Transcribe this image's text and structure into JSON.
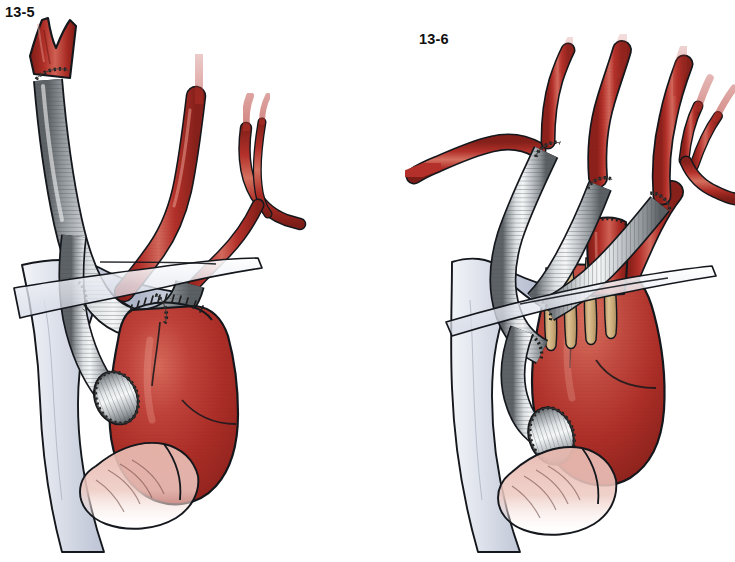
{
  "plate": {
    "background_color": "#ffffff",
    "width": 735,
    "height": 562,
    "subject": "surgical-illustration-aortic-arch-debranching-bypass-grafts"
  },
  "figures": [
    {
      "id": "fig-13-5",
      "label": "13-5",
      "label_position": {
        "x": 5,
        "y": 4
      },
      "description": "single prosthetic bypass graft from ascending aorta to brachiocephalic artery",
      "parts": [
        {
          "name": "ascending-aorta",
          "color": "#b3312a"
        },
        {
          "name": "corrugated-dacron-graft",
          "color": "#c9ccce"
        },
        {
          "name": "proximal-anastomosis-suture-ring",
          "color": "#2b2b2b"
        },
        {
          "name": "distal-anastomosis-suture-line",
          "color": "#2b2b2b"
        },
        {
          "name": "brachiocephalic-artery-stump",
          "color": "#a82b24"
        },
        {
          "name": "left-common-carotid-artery",
          "color": "#b3312a"
        },
        {
          "name": "bifurcating-branch-vessel",
          "color": "#b3312a"
        },
        {
          "name": "pulmonary-artery",
          "color": "#cdd2de"
        },
        {
          "name": "pericardial-veil",
          "color": "#e6e9f1"
        },
        {
          "name": "atrial-appendage-tissue",
          "color": "#e8bdb4"
        }
      ]
    },
    {
      "id": "fig-13-6",
      "label": "13-6",
      "label_position": {
        "x": 419,
        "y": 31
      },
      "description": "three prosthetic bypass grafts from ascending aorta to supra-aortic branches with oversewn stump",
      "parts": [
        {
          "name": "ascending-aorta",
          "color": "#b3312a"
        },
        {
          "name": "graft-to-left-subclavian",
          "color": "#c9ccce"
        },
        {
          "name": "graft-to-left-carotid",
          "color": "#c9ccce"
        },
        {
          "name": "graft-to-brachiocephalic",
          "color": "#c9ccce"
        },
        {
          "name": "trifurcation-anastomosis-sutures",
          "color": "#2b2b2b"
        },
        {
          "name": "aortic-anastomosis-suture-ring",
          "color": "#2b2b2b"
        },
        {
          "name": "oversewn-vessel-stump",
          "color": "#b3312a"
        },
        {
          "name": "tracheal-cartilage-rings",
          "color": "#cdab7a"
        },
        {
          "name": "pulmonary-artery",
          "color": "#cdd2de"
        },
        {
          "name": "pericardial-veil",
          "color": "#e6e9f1"
        },
        {
          "name": "atrial-appendage-tissue",
          "color": "#e8bdb4"
        }
      ]
    }
  ],
  "palette": {
    "artery_red_dark": "#8e2019",
    "artery_red": "#b3312a",
    "artery_red_light": "#d4675c",
    "artery_highlight": "#e79a8e",
    "graft_gray_dark": "#6f7478",
    "graft_gray": "#b9bdc0",
    "graft_gray_light": "#eceef0",
    "suture_dark": "#1f1f1f",
    "vein_blue_gray": "#cdd2de",
    "vein_blue_light": "#eef0f6",
    "cartilage_tan": "#cdab7a",
    "tissue_pink": "#e8bdb4",
    "outline": "#111111",
    "background": "#ffffff"
  }
}
